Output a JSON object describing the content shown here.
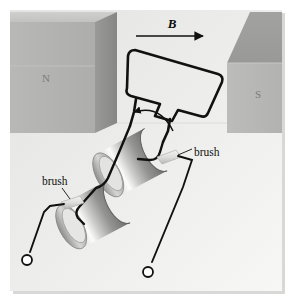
{
  "figure": {
    "background_color": "#e9e9e7",
    "page_color": "#ffffff",
    "wire_color": "#111111",
    "magnet_front_color": "#b4b4b2",
    "magnet_top_color": "#c9c9c7",
    "magnet_side_color": "#8f8f8d",
    "ring_light_color": "#f2f2f0",
    "ring_mid_color": "#b9b9b7",
    "ring_dark_color": "#6e6e6c"
  },
  "labels": {
    "field": "B",
    "north_pole": "N",
    "south_pole": "S",
    "brush_right": "brush",
    "brush_left": "brush"
  },
  "annotations": {
    "field_arrow": "field-direction-arrow",
    "rotation_arrow": "rotation-direction-arrow"
  },
  "components": {
    "magnet_north": "north-pole-magnet",
    "magnet_south": "south-pole-magnet",
    "coil": "current-loop-coil",
    "slip_ring_upper": "upper-slip-ring",
    "slip_ring_lower": "lower-slip-ring",
    "brush_upper": "upper-brush-contact",
    "brush_lower": "lower-brush-contact",
    "terminal_left": "left-terminal",
    "terminal_right": "right-terminal"
  }
}
